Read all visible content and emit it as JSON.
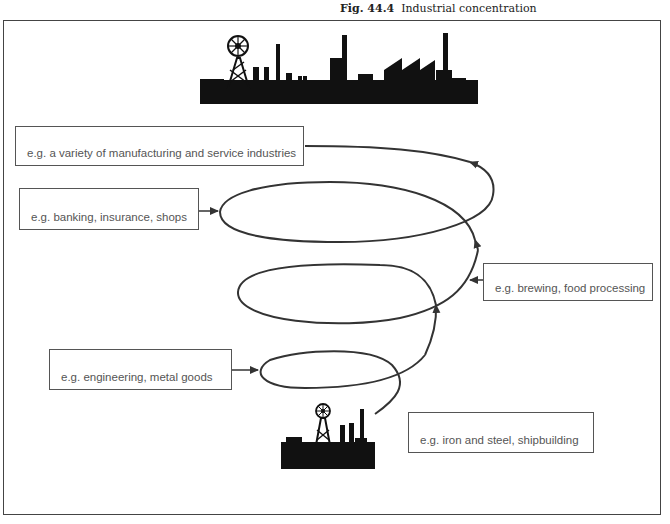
{
  "figure": {
    "number": "Fig. 44.4",
    "title": "Industrial concentration"
  },
  "labels": {
    "top": "e.g. a variety of manufacturing and service industries",
    "loop3": "e.g. banking, insurance, shops",
    "loop2": "e.g. brewing, food processing",
    "loop1": "e.g. engineering, metal goods",
    "base": "e.g. iron and steel, shipbuilding"
  },
  "icons": {
    "large_town": "industrial-skyline-icon",
    "small_town": "small-industrial-town-icon"
  },
  "colors": {
    "line": "#333333",
    "silhouette": "#111111",
    "label_text": "#555555"
  }
}
